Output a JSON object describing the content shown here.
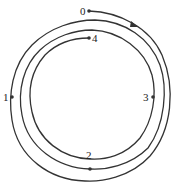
{
  "diagram": {
    "type": "spiral-path",
    "stroke_color": "#333333",
    "labels": {
      "p0": "0",
      "p1": "1",
      "p2": "2",
      "p3": "3",
      "p4": "4"
    },
    "points": [
      {
        "id": "0",
        "position": "top start"
      },
      {
        "id": "1",
        "position": "left, outer loop"
      },
      {
        "id": "2",
        "position": "bottom, middle loop"
      },
      {
        "id": "3",
        "position": "right, inner loop"
      },
      {
        "id": "4",
        "position": "top end, inner loop"
      }
    ],
    "direction": "clockwise"
  }
}
